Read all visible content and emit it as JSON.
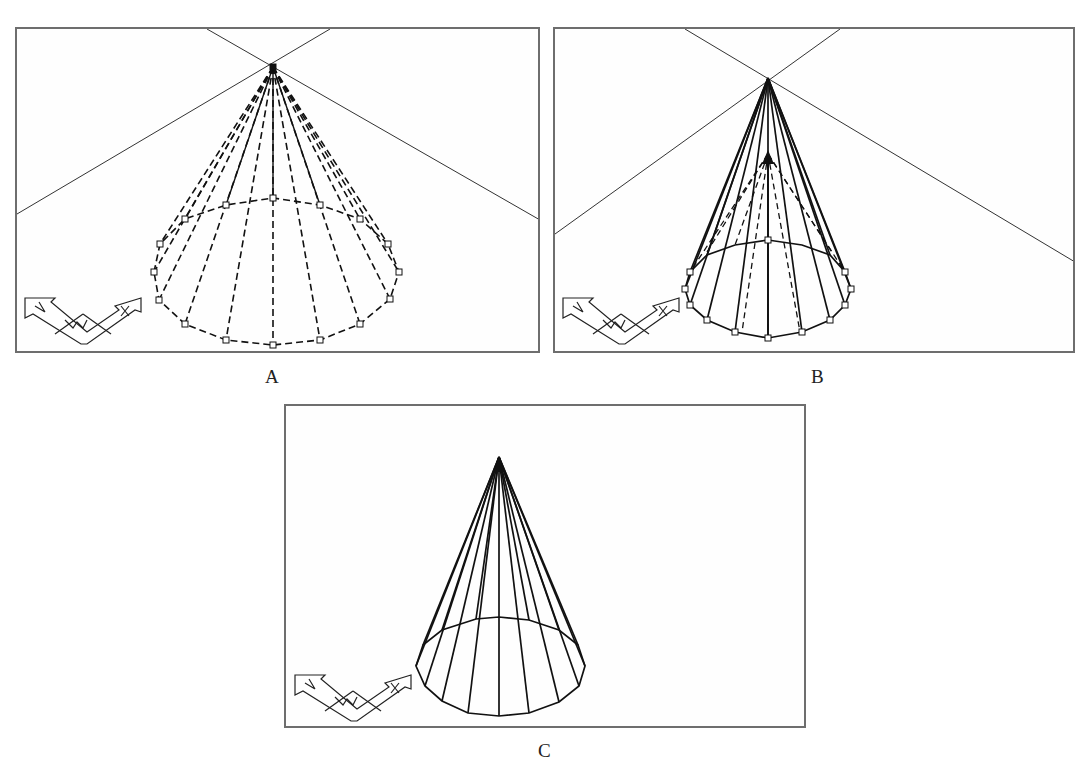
{
  "figure": {
    "panels": [
      {
        "id": "A",
        "label": "A",
        "description": "Cone with dashed wireframe lines, grips at base and apex, crosshair cursor at apex"
      },
      {
        "id": "B",
        "label": "B",
        "description": "Cone being stretched: solid lines to raised apex over dashed original cone"
      },
      {
        "id": "C",
        "label": "C",
        "description": "Resulting taller cone wireframe"
      }
    ],
    "ucs_icon": {
      "axes": [
        "X",
        "Y",
        "W"
      ]
    }
  },
  "colors": {
    "stroke": "#1a1a1a",
    "border": "#6e6e6e",
    "background": "#ffffff"
  }
}
